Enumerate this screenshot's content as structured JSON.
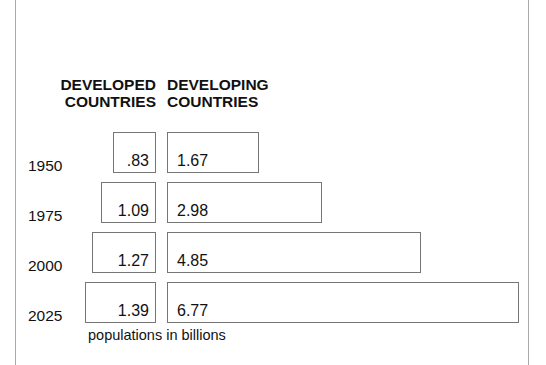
{
  "figure": {
    "caption": "populations in billions",
    "headers": {
      "developed": "DEVELOPED\nCOUNTRIES",
      "developing": "DEVELOPING\nCOUNTRIES"
    },
    "frame_color": "#a9a9a9",
    "bar_border_color": "#767676",
    "bar_fill_color": "#ffffff",
    "text_color": "#111111"
  },
  "chart_data": {
    "type": "bar",
    "title": "",
    "subtitle": "",
    "xlabel": "populations in billions",
    "ylabel": "",
    "orientation": "horizontal",
    "grid": false,
    "legend_position": "top",
    "categories": [
      "1950",
      "1975",
      "2000",
      "2025"
    ],
    "series": [
      {
        "name": "DEVELOPED COUNTRIES",
        "values": [
          0.83,
          1.09,
          1.27,
          1.39
        ],
        "labels": [
          ".83",
          "1.09",
          "1.27",
          "1.39"
        ]
      },
      {
        "name": "DEVELOPING COUNTRIES",
        "values": [
          1.67,
          2.98,
          4.85,
          6.77
        ],
        "labels": [
          "1.67",
          "2.98",
          "4.85",
          "6.77"
        ]
      }
    ],
    "units": "billions of people",
    "xlim": [
      0,
      7
    ]
  },
  "rows": [
    {
      "year": "1950",
      "developed": {
        "label": ".83",
        "value": 0.83,
        "bar_left": 113,
        "bar_right": 156,
        "top": 132
      },
      "developing": {
        "label": "1.67",
        "value": 1.67,
        "bar_left": 167,
        "bar_right": 259,
        "top": 132
      }
    },
    {
      "year": "1975",
      "developed": {
        "label": "1.09",
        "value": 1.09,
        "bar_left": 101,
        "bar_right": 156,
        "top": 182
      },
      "developing": {
        "label": "2.98",
        "value": 2.98,
        "bar_left": 167,
        "bar_right": 322,
        "top": 182
      }
    },
    {
      "year": "2000",
      "developed": {
        "label": "1.27",
        "value": 1.27,
        "bar_left": 92,
        "bar_right": 156,
        "top": 232
      },
      "developing": {
        "label": "4.85",
        "value": 4.85,
        "bar_left": 167,
        "bar_right": 421,
        "top": 232
      }
    },
    {
      "year": "2025",
      "developed": {
        "label": "1.39",
        "value": 1.39,
        "bar_left": 85,
        "bar_right": 156,
        "top": 282
      },
      "developing": {
        "label": "6.77",
        "value": 6.77,
        "bar_left": 167,
        "bar_right": 519,
        "top": 282
      }
    }
  ]
}
